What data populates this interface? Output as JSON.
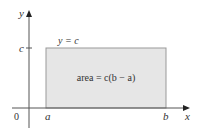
{
  "diagram": {
    "axes": {
      "x_label": "x",
      "y_label": "y",
      "origin_label": "0"
    },
    "ticks": {
      "y_tick": "c",
      "x_ticks": [
        "a",
        "b"
      ]
    },
    "line_label": "y = c",
    "area_label": "area = c(b − a)",
    "colors": {
      "rect_fill": "#e6e6e6",
      "rect_stroke": "#999999",
      "axis": "#555555"
    }
  }
}
